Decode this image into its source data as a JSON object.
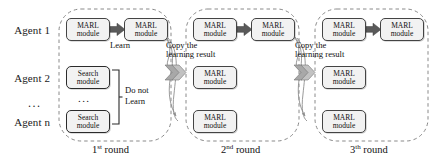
{
  "figure": {
    "type": "diagram"
  },
  "agents": {
    "labels": [
      {
        "id": "agent-1",
        "text": "Agent 1"
      },
      {
        "id": "agent-2",
        "text": "Agent 2"
      },
      {
        "id": "agent-n",
        "text": "Agent n"
      }
    ],
    "ellipsis": "..."
  },
  "modules": {
    "marl": {
      "line1": "MARL",
      "line2": "module"
    },
    "search": {
      "line1": "Search",
      "line2": "module"
    },
    "ellipsis": "..."
  },
  "annotations": {
    "learn": "Learn",
    "do_not_learn_line1": "Do not",
    "do_not_learn_line2": "Learn",
    "copy_round2": "Copy the learning result",
    "copy_round3": "Copy the learning result"
  },
  "rounds": [
    {
      "id": "round-1",
      "ordinal": "1",
      "suffix": "st",
      "word": "round"
    },
    {
      "id": "round-2",
      "ordinal": "2",
      "suffix": "nd",
      "word": "round"
    },
    {
      "id": "round-3",
      "ordinal": "3",
      "suffix": "th",
      "word": "round"
    }
  ],
  "colors": {
    "box_fill": "#f2f2f2",
    "box_stroke": "#2b2b2b",
    "arrow_fill": "#5a5a5a",
    "chevron_fill": "#9a9a9a",
    "dashed_stroke": "#8a8a8a",
    "curve_stroke": "#8f8f8f",
    "text": "#111111",
    "background": "#ffffff"
  }
}
